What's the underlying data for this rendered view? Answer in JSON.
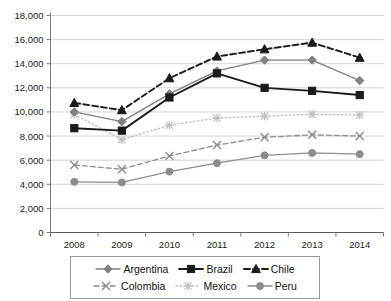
{
  "chart_data": {
    "type": "line",
    "title": "",
    "subtitle": "",
    "xlabel": "",
    "ylabel": "",
    "categories": [
      "2008",
      "2009",
      "2010",
      "2011",
      "2012",
      "2013",
      "2014"
    ],
    "x": [
      2008,
      2009,
      2010,
      2011,
      2012,
      2013,
      2014
    ],
    "ylim": [
      0,
      18000
    ],
    "ytick_values": [
      0,
      2000,
      4000,
      6000,
      8000,
      10000,
      12000,
      14000,
      16000,
      18000
    ],
    "ytick_labels": [
      "0",
      "2,000",
      "4,000",
      "6,000",
      "8,000",
      "10,000",
      "12,000",
      "14,000",
      "16,000",
      "18,000"
    ],
    "grid": true,
    "grid_axis": "y",
    "legend_position": "bottom",
    "series": [
      {
        "name": "Argentina",
        "values": [
          10000,
          9200,
          11500,
          13400,
          14300,
          14300,
          12600
        ],
        "color": "#808080",
        "line_style": "solid",
        "marker": "diamond"
      },
      {
        "name": "Brazil",
        "values": [
          8650,
          8450,
          11200,
          13200,
          12000,
          11750,
          11400
        ],
        "color": "#1a1a1a",
        "line_style": "solid",
        "marker": "square"
      },
      {
        "name": "Chile",
        "values": [
          10750,
          10150,
          12800,
          14600,
          15200,
          15750,
          14500
        ],
        "color": "#1a1a1a",
        "line_style": "dashed",
        "marker": "triangle"
      },
      {
        "name": "Colombia",
        "values": [
          5600,
          5250,
          6350,
          7250,
          7900,
          8100,
          8000
        ],
        "color": "#8c8c8c",
        "line_style": "dashed",
        "marker": "x"
      },
      {
        "name": "Mexico",
        "values": [
          9800,
          7700,
          8900,
          9500,
          9650,
          9800,
          9750
        ],
        "color": "#bdbdbd",
        "line_style": "dotted",
        "marker": "asterisk"
      },
      {
        "name": "Peru",
        "values": [
          4200,
          4150,
          5050,
          5750,
          6400,
          6600,
          6500
        ],
        "color": "#8c8c8c",
        "line_style": "solid",
        "marker": "circle"
      }
    ]
  },
  "legend": {
    "rows": [
      [
        "Argentina",
        "Brazil",
        "Chile"
      ],
      [
        "Colombia",
        "Mexico",
        "Peru"
      ]
    ]
  },
  "axes": {
    "y_axis_name": "value-axis",
    "x_axis_name": "year-axis"
  }
}
